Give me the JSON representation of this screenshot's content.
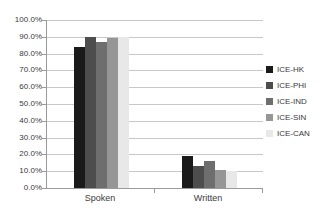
{
  "chart_data": {
    "type": "bar",
    "title": "",
    "subtitle": "",
    "xlabel": "",
    "ylabel": "",
    "categories": [
      "Spoken",
      "Written"
    ],
    "series": [
      {
        "name": "ICE-HK",
        "color": "#1a1a1a",
        "values": [
          84.0,
          19.0
        ]
      },
      {
        "name": "ICE-PHI",
        "color": "#4d4d4d",
        "values": [
          90.0,
          13.0
        ]
      },
      {
        "name": "ICE-IND",
        "color": "#6e6e6e",
        "values": [
          87.0,
          16.0
        ]
      },
      {
        "name": "ICE-SIN",
        "color": "#969696",
        "values": [
          89.0,
          11.0
        ]
      },
      {
        "name": "ICE-CAN",
        "color": "#e8e8e8",
        "values": [
          90.0,
          10.0
        ]
      }
    ],
    "ylim": [
      0,
      100
    ],
    "ytick_step": 10,
    "ytick_labels": [
      "100.0%",
      "90.0%",
      "80.0%",
      "70.0%",
      "60.0%",
      "50.0%",
      "40.0%",
      "30.0%",
      "20.0%",
      "10.0%",
      "0.0%"
    ],
    "ytick_values": [
      100,
      90,
      80,
      70,
      60,
      50,
      40,
      30,
      20,
      10,
      0
    ],
    "grid": true,
    "legend_position": "right",
    "legend_entries": [
      "ICE-HK",
      "ICE-PHI",
      "ICE-IND",
      "ICE-SIN",
      "ICE-CAN"
    ]
  }
}
